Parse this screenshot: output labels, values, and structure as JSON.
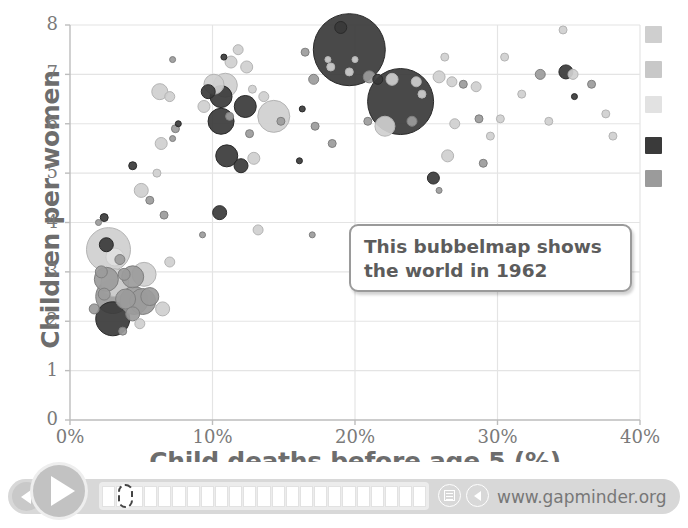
{
  "chart_data": {
    "type": "scatter",
    "title": "",
    "xlabel": "Child deaths before age 5 (%)",
    "ylabel": "Children per women",
    "xlim": [
      0,
      40
    ],
    "ylim": [
      0,
      8
    ],
    "xticks": [
      "0%",
      "10%",
      "20%",
      "30%",
      "40%"
    ],
    "xtick_values": [
      0,
      10,
      20,
      30,
      40
    ],
    "yticks": [
      "0",
      "1",
      "2",
      "3",
      "4",
      "5",
      "6",
      "7",
      "8"
    ],
    "ytick_values": [
      0,
      1,
      2,
      3,
      4,
      5,
      6,
      7,
      8
    ],
    "grid": true,
    "legend_position": "right",
    "bubble_note": "Bubble area encodes population; fill shade encodes world region group.",
    "colors": {
      "dark": "#3a3a3a",
      "mid": "#9b9b9b",
      "light": "#cfcfcf",
      "pale": "#e0e0e0",
      "grid": "#e4e4e4",
      "axis": "#bdbdbd",
      "text": "#6d6d6d"
    },
    "points": [
      {
        "x": 2.0,
        "y": 4.0,
        "r": 3,
        "c": "mid"
      },
      {
        "x": 2.4,
        "y": 4.1,
        "r": 4,
        "c": "dark"
      },
      {
        "x": 2.7,
        "y": 3.45,
        "r": 22,
        "c": "light"
      },
      {
        "x": 2.55,
        "y": 3.55,
        "r": 7,
        "c": "dark"
      },
      {
        "x": 3.15,
        "y": 3.3,
        "r": 9,
        "c": "pale"
      },
      {
        "x": 3.5,
        "y": 3.25,
        "r": 5,
        "c": "mid"
      },
      {
        "x": 2.2,
        "y": 3.0,
        "r": 6,
        "c": "mid"
      },
      {
        "x": 2.55,
        "y": 2.85,
        "r": 12,
        "c": "mid"
      },
      {
        "x": 3.15,
        "y": 2.78,
        "r": 14,
        "c": "light"
      },
      {
        "x": 3.8,
        "y": 2.95,
        "r": 6,
        "c": "mid"
      },
      {
        "x": 4.4,
        "y": 2.9,
        "r": 11,
        "c": "mid"
      },
      {
        "x": 5.2,
        "y": 2.95,
        "r": 12,
        "c": "light"
      },
      {
        "x": 2.4,
        "y": 2.55,
        "r": 6,
        "c": "mid"
      },
      {
        "x": 3.0,
        "y": 2.5,
        "r": 17,
        "c": "mid"
      },
      {
        "x": 3.9,
        "y": 2.45,
        "r": 10,
        "c": "mid"
      },
      {
        "x": 4.5,
        "y": 2.42,
        "r": 14,
        "c": "mid"
      },
      {
        "x": 5.1,
        "y": 2.4,
        "r": 13,
        "c": "mid"
      },
      {
        "x": 5.6,
        "y": 2.5,
        "r": 9,
        "c": "mid"
      },
      {
        "x": 1.7,
        "y": 2.25,
        "r": 5,
        "c": "mid"
      },
      {
        "x": 3.0,
        "y": 2.05,
        "r": 17,
        "c": "dark"
      },
      {
        "x": 4.4,
        "y": 2.15,
        "r": 7,
        "c": "mid"
      },
      {
        "x": 4.9,
        "y": 1.95,
        "r": 5,
        "c": "light"
      },
      {
        "x": 6.5,
        "y": 2.25,
        "r": 7,
        "c": "light"
      },
      {
        "x": 3.7,
        "y": 1.8,
        "r": 4,
        "c": "mid"
      },
      {
        "x": 4.4,
        "y": 5.15,
        "r": 4,
        "c": "dark"
      },
      {
        "x": 5.0,
        "y": 4.65,
        "r": 7,
        "c": "light"
      },
      {
        "x": 5.6,
        "y": 4.45,
        "r": 4,
        "c": "mid"
      },
      {
        "x": 6.1,
        "y": 5.0,
        "r": 4,
        "c": "light"
      },
      {
        "x": 6.4,
        "y": 5.6,
        "r": 6,
        "c": "light"
      },
      {
        "x": 6.6,
        "y": 4.15,
        "r": 4,
        "c": "mid"
      },
      {
        "x": 7.0,
        "y": 3.2,
        "r": 5,
        "c": "light"
      },
      {
        "x": 7.4,
        "y": 5.9,
        "r": 4,
        "c": "mid"
      },
      {
        "x": 7.6,
        "y": 6.0,
        "r": 3,
        "c": "dark"
      },
      {
        "x": 7.2,
        "y": 5.7,
        "r": 3,
        "c": "mid"
      },
      {
        "x": 6.3,
        "y": 6.65,
        "r": 8,
        "c": "light"
      },
      {
        "x": 7.0,
        "y": 6.55,
        "r": 5,
        "c": "light"
      },
      {
        "x": 7.2,
        "y": 7.3,
        "r": 3,
        "c": "mid"
      },
      {
        "x": 9.4,
        "y": 6.35,
        "r": 6,
        "c": "light"
      },
      {
        "x": 10.1,
        "y": 6.8,
        "r": 10,
        "c": "light"
      },
      {
        "x": 10.9,
        "y": 6.78,
        "r": 12,
        "c": "light"
      },
      {
        "x": 9.7,
        "y": 6.65,
        "r": 7,
        "c": "dark"
      },
      {
        "x": 10.6,
        "y": 6.55,
        "r": 11,
        "c": "dark"
      },
      {
        "x": 10.6,
        "y": 6.05,
        "r": 13,
        "c": "dark"
      },
      {
        "x": 11.0,
        "y": 5.35,
        "r": 11,
        "c": "dark"
      },
      {
        "x": 12.0,
        "y": 5.15,
        "r": 7,
        "c": "dark"
      },
      {
        "x": 10.5,
        "y": 4.2,
        "r": 7,
        "c": "dark"
      },
      {
        "x": 11.2,
        "y": 6.15,
        "r": 4,
        "c": "mid"
      },
      {
        "x": 12.3,
        "y": 6.35,
        "r": 11,
        "c": "dark"
      },
      {
        "x": 12.6,
        "y": 5.8,
        "r": 4,
        "c": "mid"
      },
      {
        "x": 12.9,
        "y": 5.3,
        "r": 6,
        "c": "light"
      },
      {
        "x": 13.2,
        "y": 3.85,
        "r": 5,
        "c": "light"
      },
      {
        "x": 11.8,
        "y": 7.5,
        "r": 5,
        "c": "light"
      },
      {
        "x": 11.3,
        "y": 7.25,
        "r": 6,
        "c": "light"
      },
      {
        "x": 10.8,
        "y": 7.35,
        "r": 3,
        "c": "dark"
      },
      {
        "x": 12.4,
        "y": 7.15,
        "r": 6,
        "c": "light"
      },
      {
        "x": 12.8,
        "y": 6.7,
        "r": 4,
        "c": "light"
      },
      {
        "x": 13.6,
        "y": 6.55,
        "r": 5,
        "c": "light"
      },
      {
        "x": 9.3,
        "y": 3.75,
        "r": 3,
        "c": "mid"
      },
      {
        "x": 14.3,
        "y": 6.15,
        "r": 16,
        "c": "light"
      },
      {
        "x": 14.8,
        "y": 6.05,
        "r": 4,
        "c": "mid"
      },
      {
        "x": 16.5,
        "y": 7.45,
        "r": 4,
        "c": "mid"
      },
      {
        "x": 17.1,
        "y": 6.9,
        "r": 5,
        "c": "mid"
      },
      {
        "x": 19.6,
        "y": 7.5,
        "r": 36,
        "c": "dark"
      },
      {
        "x": 19.0,
        "y": 7.95,
        "r": 6,
        "c": "dark"
      },
      {
        "x": 18.3,
        "y": 7.15,
        "r": 4,
        "c": "light"
      },
      {
        "x": 18.1,
        "y": 7.3,
        "r": 3,
        "c": "light"
      },
      {
        "x": 20.0,
        "y": 7.3,
        "r": 3,
        "c": "light"
      },
      {
        "x": 19.6,
        "y": 7.05,
        "r": 4,
        "c": "light"
      },
      {
        "x": 21.0,
        "y": 6.95,
        "r": 6,
        "c": "mid"
      },
      {
        "x": 21.6,
        "y": 6.9,
        "r": 5,
        "c": "dark"
      },
      {
        "x": 23.2,
        "y": 6.45,
        "r": 33,
        "c": "dark"
      },
      {
        "x": 22.6,
        "y": 6.9,
        "r": 6,
        "c": "light"
      },
      {
        "x": 24.3,
        "y": 6.85,
        "r": 5,
        "c": "light"
      },
      {
        "x": 24.7,
        "y": 6.6,
        "r": 4,
        "c": "light"
      },
      {
        "x": 22.1,
        "y": 5.95,
        "r": 10,
        "c": "light"
      },
      {
        "x": 24.0,
        "y": 6.05,
        "r": 5,
        "c": "mid"
      },
      {
        "x": 20.9,
        "y": 6.05,
        "r": 4,
        "c": "mid"
      },
      {
        "x": 17.2,
        "y": 5.95,
        "r": 4,
        "c": "mid"
      },
      {
        "x": 16.3,
        "y": 6.3,
        "r": 3,
        "c": "dark"
      },
      {
        "x": 18.4,
        "y": 5.6,
        "r": 4,
        "c": "mid"
      },
      {
        "x": 16.1,
        "y": 5.25,
        "r": 3,
        "c": "dark"
      },
      {
        "x": 17.0,
        "y": 3.75,
        "r": 3,
        "c": "mid"
      },
      {
        "x": 25.9,
        "y": 6.95,
        "r": 6,
        "c": "light"
      },
      {
        "x": 26.3,
        "y": 7.35,
        "r": 4,
        "c": "light"
      },
      {
        "x": 26.8,
        "y": 6.85,
        "r": 5,
        "c": "light"
      },
      {
        "x": 27.6,
        "y": 6.8,
        "r": 4,
        "c": "mid"
      },
      {
        "x": 28.5,
        "y": 6.75,
        "r": 5,
        "c": "light"
      },
      {
        "x": 27.0,
        "y": 6.0,
        "r": 5,
        "c": "light"
      },
      {
        "x": 28.7,
        "y": 6.1,
        "r": 4,
        "c": "mid"
      },
      {
        "x": 29.5,
        "y": 5.75,
        "r": 4,
        "c": "light"
      },
      {
        "x": 29.0,
        "y": 5.2,
        "r": 4,
        "c": "mid"
      },
      {
        "x": 26.5,
        "y": 5.35,
        "r": 6,
        "c": "light"
      },
      {
        "x": 25.5,
        "y": 4.9,
        "r": 6,
        "c": "dark"
      },
      {
        "x": 25.9,
        "y": 4.65,
        "r": 3,
        "c": "mid"
      },
      {
        "x": 30.5,
        "y": 7.35,
        "r": 4,
        "c": "light"
      },
      {
        "x": 31.7,
        "y": 6.6,
        "r": 4,
        "c": "light"
      },
      {
        "x": 33.0,
        "y": 7.0,
        "r": 5,
        "c": "mid"
      },
      {
        "x": 34.6,
        "y": 7.9,
        "r": 4,
        "c": "light"
      },
      {
        "x": 34.8,
        "y": 7.05,
        "r": 7,
        "c": "dark"
      },
      {
        "x": 35.3,
        "y": 7.0,
        "r": 5,
        "c": "light"
      },
      {
        "x": 33.6,
        "y": 6.05,
        "r": 4,
        "c": "light"
      },
      {
        "x": 35.4,
        "y": 6.55,
        "r": 3,
        "c": "dark"
      },
      {
        "x": 36.6,
        "y": 6.8,
        "r": 4,
        "c": "mid"
      },
      {
        "x": 37.6,
        "y": 6.2,
        "r": 4,
        "c": "light"
      },
      {
        "x": 38.1,
        "y": 5.75,
        "r": 4,
        "c": "light"
      },
      {
        "x": 30.2,
        "y": 6.1,
        "r": 4,
        "c": "light"
      }
    ],
    "legend_swatches": [
      {
        "label": "region-1",
        "color": "#cfcfcf",
        "y": 26
      },
      {
        "label": "region-2",
        "color": "#c8c8c8",
        "y": 61
      },
      {
        "label": "region-3",
        "color": "#e2e2e2",
        "y": 96
      },
      {
        "label": "region-4",
        "color": "#3a3a3a",
        "y": 137
      },
      {
        "label": "region-5",
        "color": "#9b9b9b",
        "y": 170
      }
    ]
  },
  "annotation": {
    "line1": "This bubbelmap shows",
    "line2": "the world in 1962"
  },
  "player": {
    "play_label": "play",
    "back_label": "step-back",
    "segment_count": 23,
    "selected_segment": 1,
    "site_url": "www.gapminder.org",
    "menu_icon": "list-icon",
    "sound_icon": "speaker-icon"
  }
}
